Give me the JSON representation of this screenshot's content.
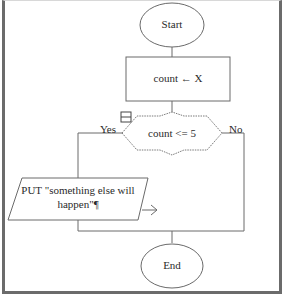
{
  "flowchart": {
    "start": {
      "label": "Start"
    },
    "assign": {
      "label": "count ← X"
    },
    "decision": {
      "label": "count <= 5",
      "yes_label": "Yes",
      "no_label": "No"
    },
    "output": {
      "line1": "PUT \"something else will",
      "line2": "happen\"¶"
    },
    "end": {
      "label": "End"
    }
  },
  "colors": {
    "stroke": "#6a6a6a",
    "frame": "#6b6b6b",
    "text": "#2a2a2a"
  }
}
